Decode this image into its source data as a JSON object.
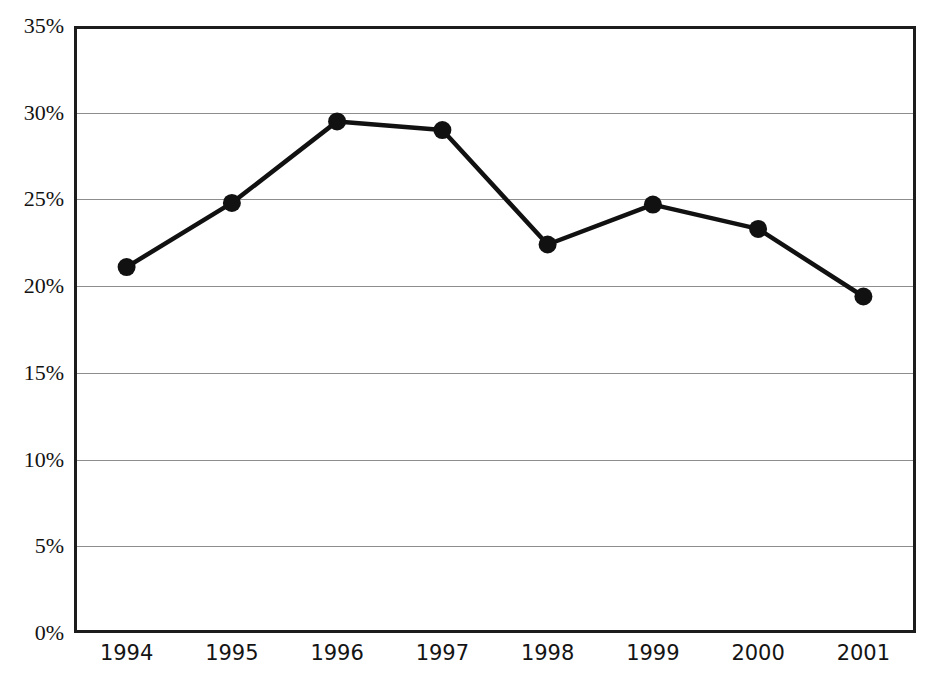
{
  "chart_data": {
    "type": "line",
    "title": "",
    "title_clipped": true,
    "subtitle": "",
    "xlabel": "",
    "ylabel": "",
    "categories": [
      "1994",
      "1995",
      "1996",
      "1997",
      "1998",
      "1999",
      "2000",
      "2001"
    ],
    "series": [
      {
        "name": "",
        "values": [
          21.1,
          24.8,
          29.5,
          29.0,
          22.4,
          24.7,
          23.3,
          19.4
        ]
      }
    ],
    "ylim": [
      0,
      35
    ],
    "ytick_values": [
      35,
      30,
      25,
      20,
      15,
      10,
      5,
      0
    ],
    "ytick_labels": [
      "35%",
      "30%",
      "25%",
      "20%",
      "15%",
      "10%",
      "5%",
      "0%"
    ],
    "ytick_step": 5,
    "value_unit": "%",
    "grid": "horizontal",
    "legend": "none",
    "marker": "filled-circle",
    "line_color": "#111111",
    "marker_color": "#111111",
    "grid_color": "#8d8d8d",
    "axis_color": "#1c1c1c",
    "background_color": "#ffffff"
  }
}
